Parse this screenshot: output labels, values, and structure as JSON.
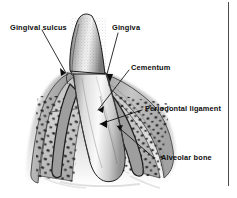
{
  "figure": {
    "style": "grayscale anatomical line drawing",
    "background_color": "#ffffff",
    "ink_color": "#0d0d0d",
    "border_line_color": "#4a4a4a"
  },
  "labels": {
    "gingival_sulcus": "Gingival sulcus",
    "gingiva": "Gingiva",
    "cementum": "Cementum",
    "periodontal_ligament": "Periodontal ligament",
    "alveolar_bone": "Alveolar bone"
  },
  "structures": {
    "enamel_crown": "enamel-crown",
    "dentin_root": "dentin-root",
    "gum_tissue": "gum-tissue",
    "cancellous_bone": "cancellous-bone",
    "ligament_space": "ligament-space",
    "pulp_canal": "pulp-canal"
  },
  "colors": {
    "enamel_light": "#efefef",
    "enamel_mid": "#b9b9b9",
    "enamel_dark": "#6e6e6e",
    "gum_light": "#e2e2e2",
    "gum_mid": "#bdbdbd",
    "gum_dark": "#8a8a8a",
    "bone_fill": "#cfcfcf",
    "bone_speck": "#2e2e2e",
    "outline": "#1a1a1a"
  }
}
